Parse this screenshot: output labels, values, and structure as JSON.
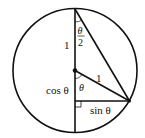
{
  "diagram": {
    "type": "unit-circle-half-angle",
    "colors": {
      "stroke": "#111111",
      "background": "#ffffff"
    },
    "geometry": {
      "center": [
        75,
        70.5
      ],
      "radius": 62,
      "top_point": [
        75,
        9
      ],
      "bottom_point": [
        75,
        132
      ],
      "circle_point": [
        129.5,
        101
      ],
      "right_angle_foot": [
        75,
        101
      ]
    },
    "labels": {
      "top_radius": "1",
      "half_angle_num": "θ",
      "half_angle_den": "2",
      "slant_radius": "1",
      "center_angle": "θ",
      "cos": "cos θ",
      "sin": "sin θ"
    }
  }
}
